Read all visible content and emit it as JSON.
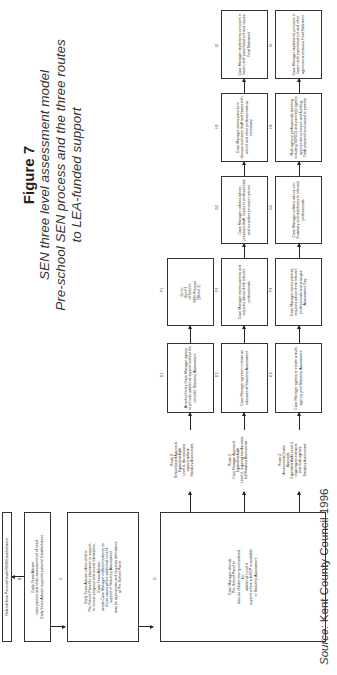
{
  "title": {
    "figure": "Figure 7",
    "subtitle_1": "SEN three level assessment model",
    "subtitle_2": "Pre-school SEN process and the three routes",
    "subtitle_3": "to LEA-funded support"
  },
  "source": {
    "label": "Source:",
    "text": " Kent County Council 1996"
  },
  "boxes": {
    "A": "Referral from Parents/Health/SSD/Establishment",
    "B_label": "B",
    "B": "Early Years Adviser\nvisits parents and child, assesses level of need.\nEarly Years Adviser supports parents/ Establishment",
    "C_label": "C",
    "C": "Early Years Adviser refers child to\nPre-School Panel for placement or support,\nto review progress and record information.\nEarly Years Adviser\nsends Case Manager collated evidence on\nthose cases where additional Level 4\nsupport or Statutory Assessment\nmay be appropriate and requests attendance\nat Pre-School Panel",
    "D_label": "D",
    "D": "Case Manager attends\nPre-School Panel to\ndiscuss children being considered\nfor\nadditional Level 4\nsupport where a full EP is available\nor Statutory Assessment",
    "E1_label": "E1",
    "E1": "At school entry Case Manager agrees to provide additional support without the need for Statutory Assessment",
    "E2_label": "E2",
    "E2": "Case Manager agrees to initiate an educational Statutory Assessment",
    "E3_label": "E3",
    "E3": "Case Manager agrees to initiate a multi-agency joint Statutory Assessment",
    "F1_label": "F1",
    "F1": "Go to\nBox F1\nof School\nSEN Process\n(Sheet 2)",
    "F2_label": "F2",
    "F2": "Case Manager meets parents and requests advice from relevant professionals",
    "F3_label": "F3",
    "F3": "Case Manager meets parents, requests advice from relevant professionals and arranges Assessment Day",
    "G2_label": "G2",
    "G2": "Case Manager collates advice, prepares draft, copies to professionals and considers provision options",
    "G3_label": "G3",
    "G3": "Case Manager collates advice into Summary and distributes to relevant professionals",
    "H2_label": "H2",
    "H2": "Case Manager meets parents to discuss and issue draft and liaises with school and other professionals as necessary",
    "H3_label": "H3",
    "H3": "Multi-agency professionals meeting including SENCO and parent(s) agrees appropriate provision and funding. Draft prepared and issued to parents",
    "I2_label": "I2",
    "I2": "Case Manager implements provision in liaison with parents/school and issues Final Statement",
    "I3_label": "I3",
    "I3": "Case Manager implements provision in liaison with parents/school and other agencies and issues Final Statement"
  },
  "routes": {
    "r1": "Route 1\nSchool based Approach\nEquivalent Audit\nLevel 4, discretionary\nsupport without\nStatutory Assessment",
    "r2": "Route 2\nCase Manager Approach\nEquivalent Audit\nLevel 4, requiring an education\nled Statutory Assessment",
    "r3": "Route 3\nAssessment Centre\nApproach\nEquivalent Audit Level 4,\nrequiring an extensive\njoint multi-agency\nStatutory Assessment"
  }
}
